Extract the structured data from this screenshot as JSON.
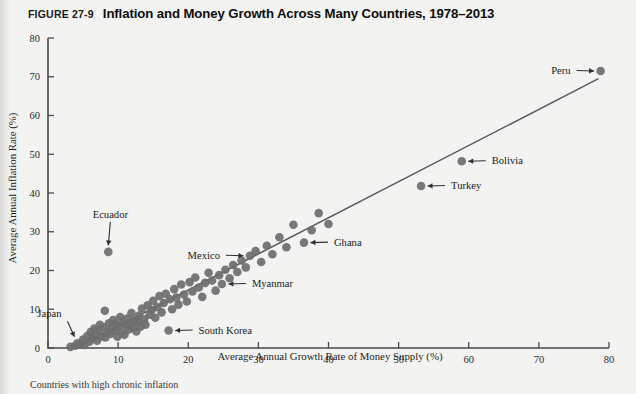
{
  "figure": {
    "number": "FIGURE 27-9",
    "title": "Inflation and Money Growth Across Many Countries, 1978–2013",
    "caption_partial": "Countries with high chronic inflation"
  },
  "chart_data": {
    "type": "scatter",
    "title": "Inflation and Money Growth Across Many Countries, 1978–2013",
    "xlabel": "Average Annual Growth Rate of Money Supply (%)",
    "ylabel": "Average Annual Inflation Rate (%)",
    "xlim": [
      0,
      80
    ],
    "ylim": [
      0,
      80
    ],
    "xticks": [
      0,
      10,
      20,
      30,
      40,
      50,
      60,
      70,
      80
    ],
    "yticks": [
      0,
      10,
      20,
      30,
      40,
      50,
      60,
      70,
      80
    ],
    "grid": false,
    "legend": "none",
    "trendline": {
      "x": [
        4.5,
        78.5
      ],
      "y": [
        0.5,
        69.5
      ],
      "style": "solid"
    },
    "labeled_points": [
      {
        "name": "Japan",
        "x": 4.2,
        "y": 1.2,
        "label_dx": -16,
        "label_dy": -26,
        "anchor": "end",
        "arrow": "down-right"
      },
      {
        "name": "Ecuador",
        "x": 8.6,
        "y": 24.8,
        "label_dx": 2,
        "label_dy": -34,
        "anchor": "middle",
        "arrow": "down"
      },
      {
        "name": "South Korea",
        "x": 17.2,
        "y": 4.5,
        "label_dx": 30,
        "label_dy": 3,
        "anchor": "start",
        "arrow": "left"
      },
      {
        "name": "Myanmar",
        "x": 24.8,
        "y": 16.5,
        "label_dx": 30,
        "label_dy": 3,
        "anchor": "start",
        "arrow": "left"
      },
      {
        "name": "Mexico",
        "x": 28.8,
        "y": 23.8,
        "label_dx": -30,
        "label_dy": 3,
        "anchor": "end",
        "arrow": "right"
      },
      {
        "name": "Ghana",
        "x": 36.5,
        "y": 27.2,
        "label_dx": 30,
        "label_dy": 3,
        "anchor": "start",
        "arrow": "left"
      },
      {
        "name": "Turkey",
        "x": 53.2,
        "y": 41.8,
        "label_dx": 30,
        "label_dy": 3,
        "anchor": "start",
        "arrow": "left"
      },
      {
        "name": "Bolivia",
        "x": 59.0,
        "y": 48.2,
        "label_dx": 30,
        "label_dy": 3,
        "anchor": "start",
        "arrow": "left"
      },
      {
        "name": "Peru",
        "x": 78.8,
        "y": 71.5,
        "label_dx": -30,
        "label_dy": 3,
        "anchor": "end",
        "arrow": "right"
      }
    ],
    "points": [
      [
        3.2,
        0.3
      ],
      [
        3.9,
        0.6
      ],
      [
        4.2,
        1.2
      ],
      [
        4.6,
        1.0
      ],
      [
        5.0,
        2.2
      ],
      [
        5.2,
        0.8
      ],
      [
        5.6,
        3.1
      ],
      [
        5.9,
        1.6
      ],
      [
        6.1,
        4.2
      ],
      [
        6.3,
        2.4
      ],
      [
        6.6,
        5.0
      ],
      [
        6.8,
        3.3
      ],
      [
        7.0,
        1.9
      ],
      [
        7.2,
        4.6
      ],
      [
        7.4,
        6.0
      ],
      [
        7.6,
        3.0
      ],
      [
        7.9,
        5.4
      ],
      [
        8.1,
        9.6
      ],
      [
        8.2,
        2.7
      ],
      [
        8.4,
        4.1
      ],
      [
        8.6,
        24.8
      ],
      [
        8.7,
        6.4
      ],
      [
        8.9,
        3.6
      ],
      [
        9.1,
        5.1
      ],
      [
        9.3,
        7.2
      ],
      [
        9.5,
        4.4
      ],
      [
        9.7,
        6.1
      ],
      [
        9.9,
        2.9
      ],
      [
        10.1,
        5.6
      ],
      [
        10.3,
        8.0
      ],
      [
        10.5,
        4.0
      ],
      [
        10.7,
        6.6
      ],
      [
        10.9,
        3.4
      ],
      [
        11.1,
        5.9
      ],
      [
        11.3,
        7.6
      ],
      [
        11.5,
        4.8
      ],
      [
        11.7,
        6.2
      ],
      [
        11.9,
        9.0
      ],
      [
        12.1,
        5.2
      ],
      [
        12.3,
        7.0
      ],
      [
        12.6,
        4.3
      ],
      [
        12.8,
        6.8
      ],
      [
        13.0,
        8.4
      ],
      [
        13.2,
        5.5
      ],
      [
        13.4,
        10.2
      ],
      [
        13.7,
        7.4
      ],
      [
        13.9,
        6.0
      ],
      [
        14.2,
        11.0
      ],
      [
        14.5,
        8.6
      ],
      [
        14.8,
        9.8
      ],
      [
        15.0,
        12.2
      ],
      [
        15.3,
        7.8
      ],
      [
        15.6,
        10.6
      ],
      [
        15.9,
        13.4
      ],
      [
        16.2,
        9.2
      ],
      [
        16.5,
        11.6
      ],
      [
        16.8,
        14.0
      ],
      [
        17.2,
        4.5
      ],
      [
        17.4,
        12.6
      ],
      [
        17.7,
        10.0
      ],
      [
        18.0,
        15.2
      ],
      [
        18.3,
        13.0
      ],
      [
        18.6,
        11.2
      ],
      [
        19.0,
        16.4
      ],
      [
        19.4,
        13.8
      ],
      [
        19.8,
        12.0
      ],
      [
        20.2,
        17.0
      ],
      [
        20.6,
        14.6
      ],
      [
        21.0,
        18.2
      ],
      [
        21.5,
        15.6
      ],
      [
        22.0,
        13.2
      ],
      [
        22.4,
        16.8
      ],
      [
        22.9,
        19.4
      ],
      [
        23.4,
        17.4
      ],
      [
        23.9,
        14.8
      ],
      [
        24.4,
        18.8
      ],
      [
        24.8,
        16.5
      ],
      [
        25.3,
        20.2
      ],
      [
        25.9,
        18.0
      ],
      [
        26.4,
        21.4
      ],
      [
        27.0,
        19.6
      ],
      [
        27.6,
        22.6
      ],
      [
        28.2,
        20.8
      ],
      [
        28.8,
        23.8
      ],
      [
        29.6,
        25.0
      ],
      [
        30.4,
        22.2
      ],
      [
        31.2,
        26.4
      ],
      [
        32.0,
        24.2
      ],
      [
        33.0,
        28.6
      ],
      [
        34.0,
        26.0
      ],
      [
        35.0,
        31.8
      ],
      [
        36.5,
        27.2
      ],
      [
        37.6,
        30.4
      ],
      [
        38.6,
        34.8
      ],
      [
        40.0,
        32.0
      ],
      [
        53.2,
        41.8
      ],
      [
        59.0,
        48.2
      ],
      [
        78.8,
        71.5
      ]
    ]
  }
}
